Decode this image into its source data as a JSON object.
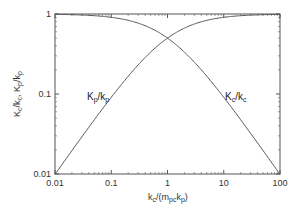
{
  "chart_data": {
    "type": "line",
    "title": "",
    "xlabel": "k_c/(m_pc k_p)",
    "ylabel": "K_c/k_c, K_p/k_p",
    "xscale": "log",
    "yscale": "log",
    "xlim": [
      0.01,
      100
    ],
    "ylim": [
      0.01,
      1
    ],
    "x_ticks": [
      0.01,
      0.1,
      1,
      10,
      100
    ],
    "x_tick_labels": [
      "0.01",
      "0.1",
      "1",
      "10",
      "100"
    ],
    "y_ticks": [
      0.01,
      0.1,
      1
    ],
    "y_tick_labels": [
      "0.01",
      "0.1",
      "1"
    ],
    "grid": false,
    "legend": "inline labels",
    "x": [
      0.01,
      0.02,
      0.05,
      0.1,
      0.2,
      0.5,
      1,
      2,
      5,
      10,
      20,
      50,
      100
    ],
    "series": [
      {
        "name": "K_p/k_p",
        "label_main": "K",
        "label_sub1": "p",
        "label_mid": "/k",
        "label_sub2": "p",
        "values": [
          0.0099,
          0.0196,
          0.0476,
          0.0909,
          0.167,
          0.333,
          0.5,
          0.667,
          0.833,
          0.909,
          0.952,
          0.98,
          0.99
        ]
      },
      {
        "name": "K_c/k_c",
        "label_main": "K",
        "label_sub1": "c",
        "label_mid": "/k",
        "label_sub2": "c",
        "values": [
          0.99,
          0.98,
          0.952,
          0.909,
          0.833,
          0.667,
          0.5,
          0.333,
          0.167,
          0.0909,
          0.0476,
          0.0196,
          0.0099
        ]
      }
    ],
    "colors": {
      "line": "#555555",
      "frame": "#555555",
      "text": "#333333"
    }
  }
}
